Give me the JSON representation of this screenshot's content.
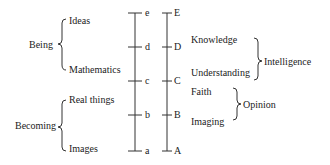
{
  "left_groups": [
    {
      "label": "Being",
      "items": [
        "Ideas",
        "Mathematics"
      ]
    },
    {
      "label": "Becoming",
      "items": [
        "Real things",
        "Images"
      ]
    }
  ],
  "line_lower": {
    "points": [
      "e",
      "d",
      "c",
      "b",
      "a"
    ]
  },
  "line_upper": {
    "points": [
      "E",
      "D",
      "C",
      "B",
      "A"
    ]
  },
  "right_items": [
    "Knowledge",
    "Understanding",
    "Faith",
    "Imaging"
  ],
  "right_groups": [
    {
      "label": "Intelligence"
    },
    {
      "label": "Opinion"
    }
  ]
}
